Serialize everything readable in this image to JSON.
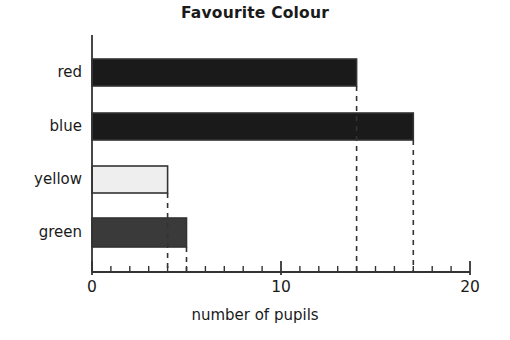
{
  "chart_data": {
    "type": "bar",
    "orientation": "horizontal",
    "title": "Favourite Colour",
    "xlabel": "number of pupils",
    "ylabel": "",
    "categories": [
      "red",
      "blue",
      "yellow",
      "green"
    ],
    "values": [
      14,
      17,
      4,
      5
    ],
    "bar_fills": [
      "#1a1a1a",
      "#1a1a1a",
      "#eeeeee",
      "#3a3a3a"
    ],
    "bar_stroke": "#333333",
    "xlim": [
      0,
      20
    ],
    "major_ticks": [
      0,
      10,
      20
    ],
    "major_tick_labels": [
      "0",
      "10",
      "20"
    ],
    "minor_tick_step": 1,
    "grid": false,
    "legend": "none",
    "leader_lines": {
      "style": "dashed",
      "color": "#333333",
      "at_values": [
        14,
        17,
        4,
        5
      ]
    },
    "axis_color": "#333333"
  },
  "colors": {
    "ink": "#1a1a1a",
    "axis": "#333333",
    "bar_dark": "#1a1a1a",
    "bar_mid": "#3a3a3a",
    "bar_light": "#eeeeee",
    "background": "#ffffff"
  }
}
